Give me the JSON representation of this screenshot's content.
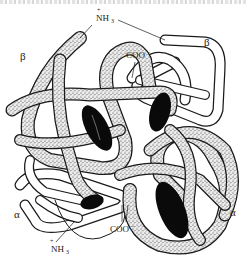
{
  "figure": {
    "labels": {
      "beta_left": "β",
      "beta_right": "β",
      "alpha_left": "α",
      "alpha_right": "α",
      "nh3_top": "NH",
      "nh3_top_sub": "3",
      "nh3_top_charge": "+",
      "coo_top": "COO",
      "coo_top_charge": "−",
      "coo_bottom": "COO",
      "coo_bottom_charge": "−",
      "nh3_bottom": "NH",
      "nh3_bottom_sub": "3",
      "nh3_bottom_charge": "+"
    },
    "subunits": [
      {
        "name": "beta-1",
        "style": "stippled"
      },
      {
        "name": "beta-2",
        "style": "white"
      },
      {
        "name": "alpha-1",
        "style": "white"
      },
      {
        "name": "alpha-2",
        "style": "stippled"
      }
    ],
    "heme_groups": 4,
    "colors": {
      "outline": "#1a1a1a",
      "stipple_bg": "#e9e9e9",
      "stipple_dot": "#3a3a3a",
      "heme": "#0a0a0a",
      "white_tube": "#ffffff"
    }
  }
}
